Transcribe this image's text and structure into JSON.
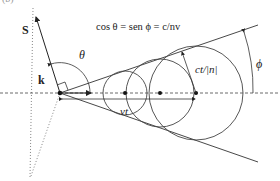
{
  "diagram": {
    "panel_label": "(b)",
    "formula": "cos θ = sen ϕ = c/nv",
    "labels": {
      "S": "S",
      "k": "k",
      "theta": "θ",
      "phi": "ϕ",
      "ct_over_n": "ct/|n|",
      "vt": "vt"
    },
    "apex": [
      60,
      93
    ],
    "circle_centers_x": [
      125,
      160,
      196
    ],
    "colors": {
      "stroke": "#333333",
      "background": "#ffffff"
    }
  }
}
